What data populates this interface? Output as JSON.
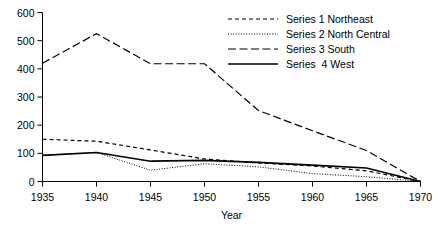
{
  "chart_data": {
    "type": "line",
    "title": "",
    "xlabel": "Year",
    "ylabel": "",
    "x": [
      1935,
      1940,
      1945,
      1950,
      1955,
      1960,
      1965,
      1970
    ],
    "xtick_labels": [
      "1935",
      "1940",
      "1945",
      "1950",
      "1955",
      "1960",
      "1965",
      "1970"
    ],
    "ytick_labels": [
      "0",
      "100",
      "200",
      "300",
      "400",
      "500",
      "600"
    ],
    "yticks": [
      0,
      100,
      200,
      300,
      400,
      500,
      600
    ],
    "xlim": [
      1935,
      1970
    ],
    "ylim": [
      0,
      600
    ],
    "grid": false,
    "legend_position": "top-right",
    "series": [
      {
        "name": "Series 1 Northeast",
        "line_style": "dashed",
        "color": "#000000",
        "values": [
          150,
          143,
          112,
          80,
          66,
          55,
          38,
          0
        ]
      },
      {
        "name": "Series 2 North Central",
        "line_style": "dotted",
        "color": "#000000",
        "values": [
          93,
          103,
          40,
          63,
          52,
          28,
          17,
          0
        ]
      },
      {
        "name": "Series 3 South",
        "line_style": "long-dashed",
        "color": "#000000",
        "values": [
          420,
          525,
          418,
          418,
          252,
          180,
          110,
          0
        ]
      },
      {
        "name": "Series  4 West",
        "line_style": "solid",
        "color": "#000000",
        "values": [
          93,
          103,
          72,
          75,
          68,
          58,
          48,
          0
        ]
      }
    ]
  },
  "legend": {
    "items": [
      {
        "label": "Series 1 Northeast"
      },
      {
        "label": "Series 2 North Central"
      },
      {
        "label": "Series 3 South"
      },
      {
        "label": "Series  4 West"
      }
    ]
  },
  "axes": {
    "x_title": "Year"
  }
}
